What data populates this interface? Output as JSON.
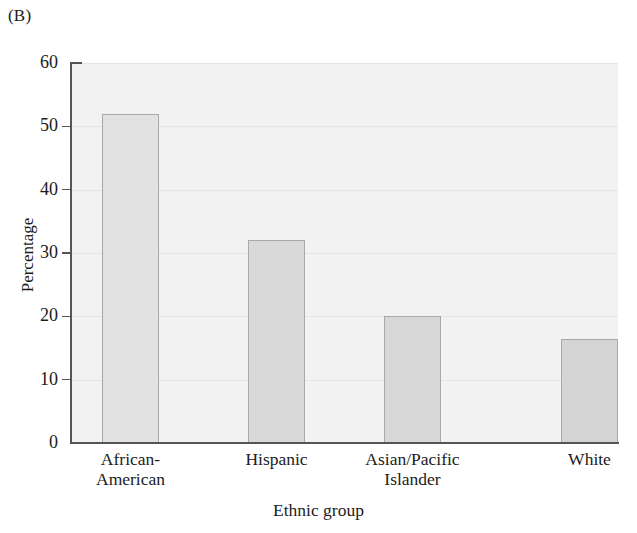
{
  "figure": {
    "panel_label": "(B)"
  },
  "chart_data": {
    "type": "bar",
    "title": "",
    "subtitle": "",
    "panel": "(B)",
    "categories": [
      "African-American",
      "Hispanic",
      "Asian/Pacific Islander",
      "White"
    ],
    "category_lines": [
      [
        "African-",
        "American"
      ],
      [
        "Hispanic",
        ""
      ],
      [
        "Asian/Pacific",
        "Islander"
      ],
      [
        "White",
        ""
      ]
    ],
    "values": [
      52,
      32,
      20,
      16.5
    ],
    "xlabel": "Ethnic group",
    "ylabel": "Percentage",
    "ylim": [
      0,
      60
    ],
    "ytick_labels": [
      "0",
      "10",
      "20",
      "30",
      "40",
      "50",
      "60"
    ],
    "ytick_values": [
      0,
      10,
      20,
      30,
      40,
      50,
      60
    ],
    "grid": "horizontal",
    "legend": "none",
    "bar_fill_colors": [
      "#e2e2e2",
      "#d9d9d9",
      "#d7d7d7",
      "#d4d4d4"
    ],
    "bar_border_color": "#a9a9a9",
    "plot_background": "#f2f2f2",
    "axis_color": "#555555",
    "gridline_color": "#e4e4e4"
  }
}
